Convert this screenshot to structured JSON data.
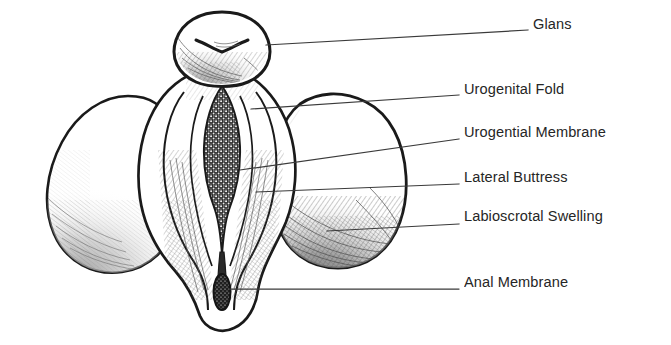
{
  "figure": {
    "style": "pen-and-ink line drawing with hatching and stipple",
    "background_color": "#ffffff",
    "ink_color": "#1a1a1a",
    "shading_color": "#8a8a8a",
    "label_text_color": "#262626",
    "leader_line_color": "#3a3a3a"
  },
  "labels": [
    {
      "id": "glans",
      "text": "Glans",
      "text_x": 533,
      "text_y": 23,
      "leader": {
        "x1": 266,
        "y1": 45,
        "x2": 528,
        "y2": 30
      },
      "target": "rounded knob at top of central structure"
    },
    {
      "id": "urogenital-fold",
      "text": "Urogenital Fold",
      "text_x": 464,
      "text_y": 88,
      "leader": {
        "x1": 251,
        "y1": 109,
        "x2": 459,
        "y2": 95
      },
      "target": "inner longitudinal fold flanking the membrane"
    },
    {
      "id": "urogential-membrane",
      "text": "Urogential Membrane",
      "text_x": 464,
      "text_y": 131,
      "leader": {
        "x1": 240,
        "y1": 170,
        "x2": 459,
        "y2": 139
      },
      "target": "stippled oval in midline"
    },
    {
      "id": "lateral-buttress",
      "text": "Lateral Buttress",
      "text_x": 464,
      "text_y": 176,
      "leader": {
        "x1": 256,
        "y1": 192,
        "x2": 459,
        "y2": 184
      },
      "target": "outer ridge of central structure"
    },
    {
      "id": "labioscrotal-swelling",
      "text": "Labioscrotal Swelling",
      "text_x": 464,
      "text_y": 215,
      "leader": {
        "x1": 327,
        "y1": 231,
        "x2": 459,
        "y2": 224
      },
      "target": "large paired lateral swellings"
    },
    {
      "id": "anal-membrane",
      "text": "Anal Membrane",
      "text_x": 464,
      "text_y": 281,
      "leader": {
        "x1": 229,
        "y1": 289,
        "x2": 459,
        "y2": 289
      },
      "target": "small dark oval at caudal end"
    }
  ],
  "structures": [
    {
      "id": "glans",
      "kind": "rounded-knob",
      "shading": "hatched-lower-left-and-bottom"
    },
    {
      "id": "left-labioscrotal-swelling",
      "kind": "large-oval",
      "shading": "soft-gray-lower-left"
    },
    {
      "id": "right-labioscrotal-swelling",
      "kind": "large-oval",
      "shading": "heavy-hatch-lower-half"
    },
    {
      "id": "central-shaft",
      "kind": "tapering-column",
      "shading": "hatched-flanks"
    },
    {
      "id": "urogenital-membrane",
      "kind": "stippled-oval",
      "shading": "dark-with-white-stipple"
    },
    {
      "id": "anal-membrane",
      "kind": "small-dark-oval",
      "shading": "solid-dark-stipple"
    },
    {
      "id": "urogenital-folds",
      "kind": "paired-inner-fold-lines",
      "shading": "light-hatch"
    }
  ]
}
